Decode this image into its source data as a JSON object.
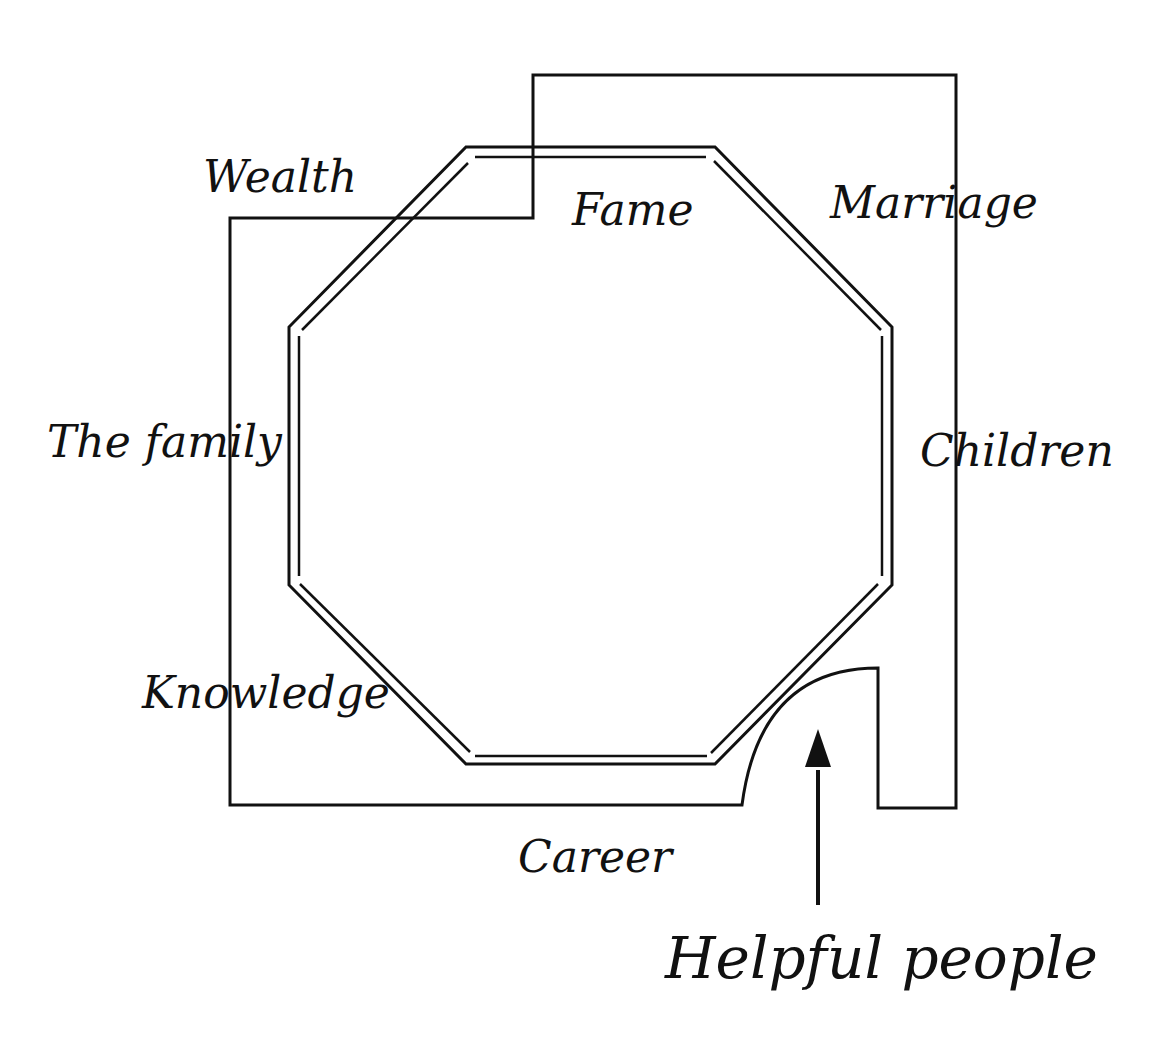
{
  "diagram": {
    "type": "bagua-floor-plan",
    "colors": {
      "line": "#111111",
      "background": "#ffffff"
    },
    "areas": {
      "wealth": "Wealth",
      "fame": "Fame",
      "marriage": "Marriage",
      "family": "The family",
      "children": "Children",
      "knowledge": "Knowledge",
      "career": "Career",
      "helpful_people": "Helpful people"
    }
  }
}
